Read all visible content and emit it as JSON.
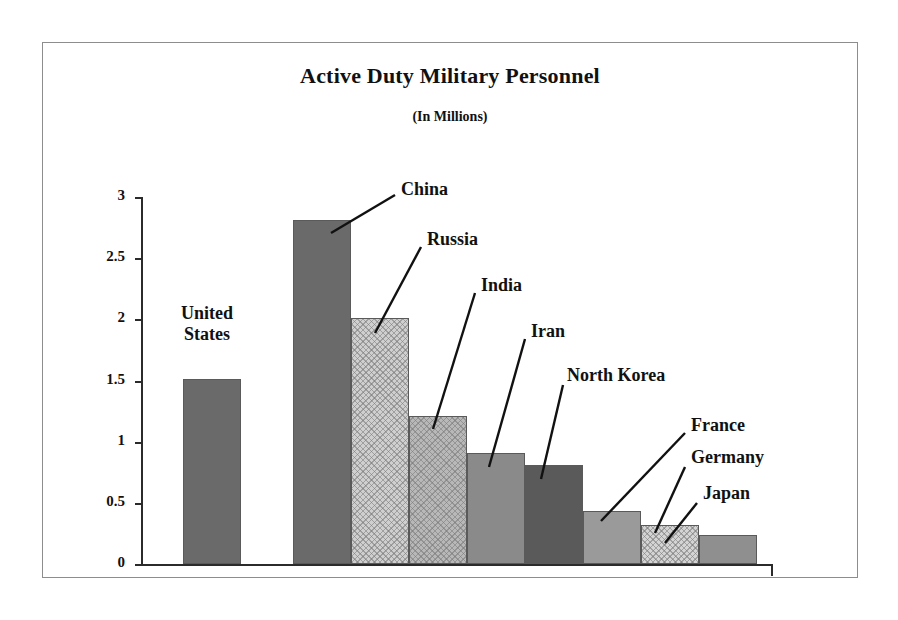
{
  "chart_data": {
    "type": "bar",
    "title": "Active Duty Military Personnel",
    "subtitle": "(In Millions)",
    "xlabel": "",
    "ylabel": "",
    "ylim": [
      0,
      3
    ],
    "ytick_labels": [
      "0",
      "0.5",
      "1",
      "1.5",
      "2",
      "2.5",
      "3"
    ],
    "ytick_values": [
      0,
      0.5,
      1,
      1.5,
      2,
      2.5,
      3
    ],
    "grid": false,
    "legend": "none",
    "units": "millions",
    "categories": [
      "United States",
      "China",
      "Russia",
      "India",
      "Iran",
      "North Korea",
      "France",
      "Germany",
      "Japan"
    ],
    "values": [
      1.51,
      2.81,
      2.01,
      1.21,
      0.91,
      0.81,
      0.43,
      0.32,
      0.24
    ],
    "bars": [
      {
        "label": "United States",
        "value": 1.51,
        "fill": "#6a6a6a",
        "pattern": "solid",
        "x": 140,
        "width": 58,
        "label_x": 164,
        "label_y": 260,
        "label_align": "center",
        "label_lines": [
          "United",
          "States"
        ],
        "leader": null
      },
      {
        "label": "China",
        "value": 2.81,
        "fill": "#6a6a6a",
        "pattern": "solid",
        "x": 250,
        "width": 58,
        "label_x": 358,
        "label_y": 136,
        "label_align": "left",
        "label_lines": [
          "China"
        ],
        "leader": {
          "x1": 352,
          "y1": 152,
          "x2": 288,
          "y2": 190
        }
      },
      {
        "label": "Russia",
        "value": 2.01,
        "fill": "#cfcfcf",
        "pattern": "cross",
        "x": 308,
        "width": 58,
        "label_x": 384,
        "label_y": 186,
        "label_align": "left",
        "label_lines": [
          "Russia"
        ],
        "leader": {
          "x1": 378,
          "y1": 204,
          "x2": 332,
          "y2": 290
        }
      },
      {
        "label": "India",
        "value": 1.21,
        "fill": "#b8b8b8",
        "pattern": "cross",
        "x": 366,
        "width": 58,
        "label_x": 438,
        "label_y": 232,
        "label_align": "left",
        "label_lines": [
          "India"
        ],
        "leader": {
          "x1": 432,
          "y1": 250,
          "x2": 390,
          "y2": 386
        }
      },
      {
        "label": "Iran",
        "value": 0.91,
        "fill": "#8a8a8a",
        "pattern": "solid",
        "x": 424,
        "width": 58,
        "label_x": 488,
        "label_y": 278,
        "label_align": "left",
        "label_lines": [
          "Iran"
        ],
        "leader": {
          "x1": 482,
          "y1": 296,
          "x2": 446,
          "y2": 424
        }
      },
      {
        "label": "North Korea",
        "value": 0.81,
        "fill": "#5a5a5a",
        "pattern": "solid",
        "x": 482,
        "width": 58,
        "label_x": 524,
        "label_y": 322,
        "label_align": "left",
        "label_lines": [
          "North Korea"
        ],
        "leader": {
          "x1": 520,
          "y1": 342,
          "x2": 498,
          "y2": 436
        }
      },
      {
        "label": "France",
        "value": 0.43,
        "fill": "#9a9a9a",
        "pattern": "solid",
        "x": 540,
        "width": 58,
        "label_x": 648,
        "label_y": 372,
        "label_align": "left",
        "label_lines": [
          "France"
        ],
        "leader": {
          "x1": 642,
          "y1": 390,
          "x2": 558,
          "y2": 478
        }
      },
      {
        "label": "Germany",
        "value": 0.32,
        "fill": "#d4d4d4",
        "pattern": "cross",
        "x": 598,
        "width": 58,
        "label_x": 648,
        "label_y": 404,
        "label_align": "left",
        "label_lines": [
          "Germany"
        ],
        "leader": {
          "x1": 642,
          "y1": 424,
          "x2": 612,
          "y2": 490
        }
      },
      {
        "label": "Japan",
        "value": 0.24,
        "fill": "#8f8f8f",
        "pattern": "solid",
        "x": 656,
        "width": 58,
        "label_x": 660,
        "label_y": 440,
        "label_align": "left",
        "label_lines": [
          "Japan"
        ],
        "leader": {
          "x1": 654,
          "y1": 460,
          "x2": 622,
          "y2": 500
        }
      }
    ],
    "colors": {
      "axis": "#2b2b2b",
      "frame": "#8d8d8d",
      "text": "#111111",
      "background": "#ffffff"
    }
  }
}
